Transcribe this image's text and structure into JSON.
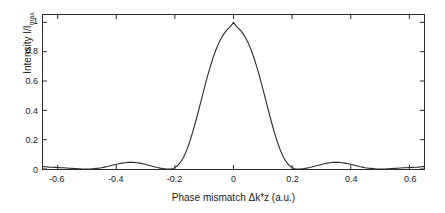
{
  "chart_data": {
    "type": "line",
    "title": "",
    "xlabel": "Phase mismatch Δk*z (a.u.)",
    "ylabel_main": "Intensity I/I",
    "ylabel_sub": "max",
    "xlim": [
      -0.65,
      0.65
    ],
    "ylim": [
      0,
      1.05
    ],
    "xticks": [
      -0.6,
      -0.4,
      -0.2,
      0,
      0.2,
      0.4,
      0.6
    ],
    "xticklabels": [
      "-0.6",
      "-0.4",
      "-0.2",
      "0",
      "0.2",
      "0.4",
      "0.6"
    ],
    "yticks": [
      0,
      0.2,
      0.4,
      0.6,
      0.8,
      1
    ],
    "yticklabels": [
      "0",
      "0.2",
      "0.4",
      "0.6",
      "0.8",
      "1"
    ],
    "grid": false,
    "legend": null,
    "series": [
      {
        "name": "sinc^2 phase matching curve",
        "color": "#2b2b2b",
        "linewidth": 1.1,
        "x": [
          -0.65,
          -0.64,
          -0.63,
          -0.62,
          -0.61,
          -0.6,
          -0.59,
          -0.58,
          -0.57,
          -0.56,
          -0.55,
          -0.54,
          -0.53,
          -0.52,
          -0.51,
          -0.5,
          -0.49,
          -0.48,
          -0.47,
          -0.46,
          -0.45,
          -0.44,
          -0.43,
          -0.42,
          -0.41,
          -0.4,
          -0.39,
          -0.38,
          -0.37,
          -0.36,
          -0.35,
          -0.34,
          -0.33,
          -0.32,
          -0.31,
          -0.3,
          -0.29,
          -0.28,
          -0.27,
          -0.26,
          -0.25,
          -0.24,
          -0.23,
          -0.22,
          -0.21,
          -0.2,
          -0.19,
          -0.18,
          -0.17,
          -0.16,
          -0.15,
          -0.14,
          -0.13,
          -0.12,
          -0.11,
          -0.1,
          -0.09,
          -0.08,
          -0.07,
          -0.06,
          -0.05,
          -0.04,
          -0.03,
          -0.02,
          -0.01,
          0,
          0.01,
          0.02,
          0.03,
          0.04,
          0.05,
          0.06,
          0.07,
          0.08,
          0.09,
          0.1,
          0.11,
          0.12,
          0.13,
          0.14,
          0.15,
          0.16,
          0.17,
          0.18,
          0.19,
          0.2,
          0.21,
          0.22,
          0.23,
          0.24,
          0.25,
          0.26,
          0.27,
          0.28,
          0.29,
          0.3,
          0.31,
          0.32,
          0.33,
          0.34,
          0.35,
          0.36,
          0.37,
          0.38,
          0.39,
          0.4,
          0.41,
          0.42,
          0.43,
          0.44,
          0.45,
          0.46,
          0.47,
          0.48,
          0.49,
          0.5,
          0.51,
          0.52,
          0.53,
          0.54,
          0.55,
          0.56,
          0.57,
          0.58,
          0.59,
          0.6,
          0.61,
          0.62,
          0.63,
          0.64,
          0.65
        ],
        "y": [
          0.016,
          0.015,
          0.013,
          0.012,
          0.011,
          0.01,
          0.009,
          0.008,
          0.007,
          0.005,
          0.004,
          0.003,
          0.002,
          0.001,
          0.0005,
          0.0,
          0.0005,
          0.002,
          0.004,
          0.006,
          0.009,
          0.013,
          0.017,
          0.022,
          0.027,
          0.032,
          0.036,
          0.04,
          0.043,
          0.045,
          0.046,
          0.045,
          0.043,
          0.04,
          0.036,
          0.031,
          0.026,
          0.021,
          0.015,
          0.01,
          0.006,
          0.003,
          0.001,
          0.0,
          0.002,
          0.009,
          0.024,
          0.048,
          0.082,
          0.127,
          0.182,
          0.246,
          0.317,
          0.392,
          0.47,
          0.548,
          0.623,
          0.693,
          0.757,
          0.813,
          0.86,
          0.899,
          0.93,
          0.954,
          0.972,
          1.0,
          0.972,
          0.954,
          0.93,
          0.899,
          0.86,
          0.813,
          0.757,
          0.693,
          0.623,
          0.548,
          0.47,
          0.392,
          0.317,
          0.246,
          0.182,
          0.127,
          0.082,
          0.048,
          0.024,
          0.009,
          0.002,
          0.0,
          0.001,
          0.003,
          0.006,
          0.01,
          0.015,
          0.021,
          0.026,
          0.031,
          0.036,
          0.04,
          0.043,
          0.045,
          0.046,
          0.045,
          0.043,
          0.04,
          0.036,
          0.032,
          0.027,
          0.022,
          0.017,
          0.013,
          0.009,
          0.006,
          0.004,
          0.002,
          0.0005,
          0.0,
          0.0005,
          0.001,
          0.002,
          0.003,
          0.004,
          0.005,
          0.007,
          0.008,
          0.009,
          0.01,
          0.011,
          0.012,
          0.013,
          0.015,
          0.016
        ]
      }
    ]
  }
}
